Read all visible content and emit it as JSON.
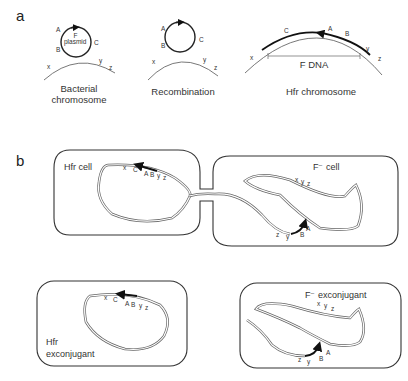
{
  "panel_a": {
    "label": "a",
    "stage1": {
      "caption_line1": "Bacterial",
      "caption_line2": "chromosome",
      "plasmid_label_f": "F",
      "plasmid_label": "plasmid",
      "genes_plasmid": [
        "A",
        "B",
        "C"
      ],
      "genes_chromosome": [
        "x",
        "y",
        "z"
      ]
    },
    "stage2": {
      "caption": "Recombination",
      "genes_plasmid": [
        "A",
        "B",
        "C"
      ],
      "genes_chromosome": [
        "x",
        "y",
        "z"
      ]
    },
    "stage3": {
      "caption": "Hfr chromosome",
      "f_dna_label": "F DNA",
      "genes": [
        "x",
        "C",
        "A",
        "B",
        "y",
        "z"
      ]
    }
  },
  "panel_b": {
    "label": "b",
    "hfr_cell": {
      "label": "Hfr cell",
      "genes": [
        "x",
        "C",
        "A",
        "B",
        "y",
        "z"
      ]
    },
    "f_minus_cell": {
      "label": "F⁻ cell",
      "genes_top": [
        "x",
        "y",
        "z"
      ],
      "genes_bottom": [
        "z",
        "y",
        "B",
        "A"
      ]
    },
    "hfr_exconjugant": {
      "label_line1": "Hfr",
      "label_line2": "exconjugant",
      "genes": [
        "x",
        "C",
        "A",
        "B",
        "y",
        "z"
      ]
    },
    "f_minus_exconjugant": {
      "label": "F⁻ exconjugant",
      "genes_top": [
        "x",
        "y",
        "z"
      ],
      "genes_bottom": [
        "z",
        "y",
        "B",
        "A"
      ]
    }
  }
}
